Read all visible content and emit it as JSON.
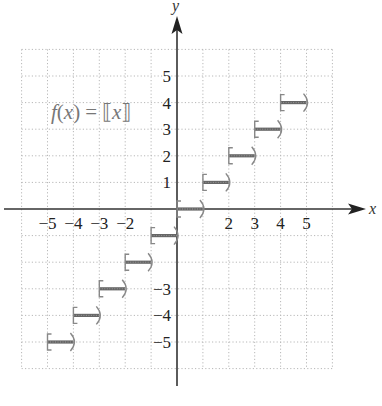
{
  "chart_data": {
    "type": "line",
    "subtype": "step-function",
    "title": "",
    "function_label": "f(x) = ⟦x⟧",
    "function_label_parts": {
      "f": "f",
      "open": "(",
      "x": "x",
      "close": ")",
      "eq": "=",
      "lb": "⟦",
      "arg": "x",
      "rb": "⟧"
    },
    "xlabel": "x",
    "ylabel": "y",
    "xlim": [
      -6,
      6
    ],
    "ylim": [
      -6,
      6
    ],
    "grid": true,
    "grid_style": "dotted",
    "x_tick_labels": [
      {
        "value": -5,
        "label": "−5"
      },
      {
        "value": -4,
        "label": "−4"
      },
      {
        "value": -3,
        "label": "−3"
      },
      {
        "value": -2,
        "label": "−2"
      },
      {
        "value": 2,
        "label": "2"
      },
      {
        "value": 3,
        "label": "3"
      },
      {
        "value": 4,
        "label": "4"
      },
      {
        "value": 5,
        "label": "5"
      }
    ],
    "y_tick_labels": [
      {
        "value": 5,
        "label": "5"
      },
      {
        "value": 4,
        "label": "4"
      },
      {
        "value": 3,
        "label": "3"
      },
      {
        "value": 2,
        "label": "2"
      },
      {
        "value": 1,
        "label": "1"
      },
      {
        "value": -3,
        "label": "−3"
      },
      {
        "value": -4,
        "label": "−4"
      },
      {
        "value": -5,
        "label": "−5"
      }
    ],
    "segments": [
      {
        "x_start": -5,
        "x_end": -4,
        "y": -5,
        "start": "closed",
        "end": "open"
      },
      {
        "x_start": -4,
        "x_end": -3,
        "y": -4,
        "start": "closed",
        "end": "open"
      },
      {
        "x_start": -3,
        "x_end": -2,
        "y": -3,
        "start": "closed",
        "end": "open"
      },
      {
        "x_start": -2,
        "x_end": -1,
        "y": -2,
        "start": "closed",
        "end": "open"
      },
      {
        "x_start": -1,
        "x_end": 0,
        "y": -1,
        "start": "closed",
        "end": "open"
      },
      {
        "x_start": 0,
        "x_end": 1,
        "y": 0,
        "start": "closed",
        "end": "open"
      },
      {
        "x_start": 1,
        "x_end": 2,
        "y": 1,
        "start": "closed",
        "end": "open"
      },
      {
        "x_start": 2,
        "x_end": 3,
        "y": 2,
        "start": "closed",
        "end": "open"
      },
      {
        "x_start": 3,
        "x_end": 4,
        "y": 3,
        "start": "closed",
        "end": "open"
      },
      {
        "x_start": 4,
        "x_end": 5,
        "y": 4,
        "start": "closed",
        "end": "open"
      }
    ],
    "legend": null
  },
  "colors": {
    "axis": "#333333",
    "grid": "#b8b8b8",
    "segment": "#666666",
    "bracket": "#888888",
    "label": "#222222",
    "function_label": "#777777"
  }
}
